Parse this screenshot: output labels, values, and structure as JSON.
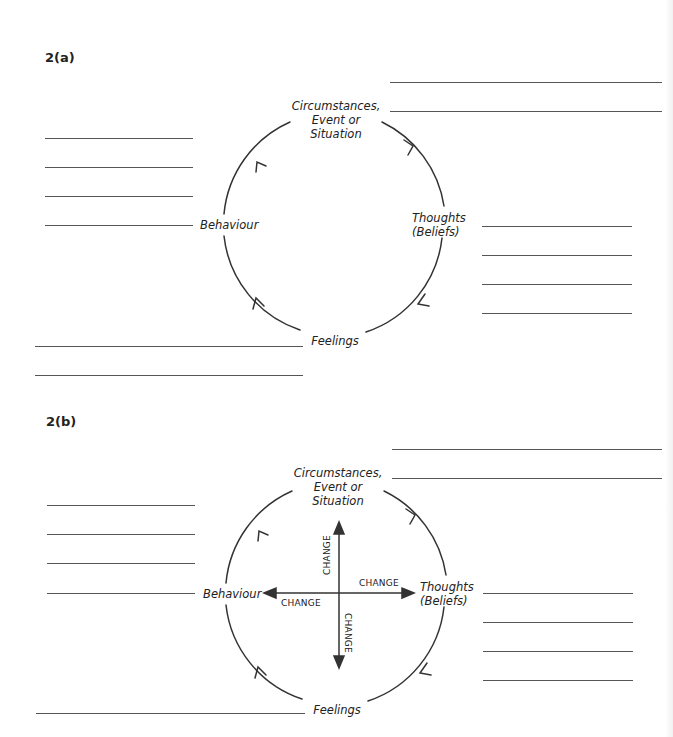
{
  "diagram_a": {
    "heading": "2(a)",
    "nodes": {
      "top": "Circumstances,\nEvent or\nSituation",
      "top_l1": "Circumstances,",
      "top_l2": "Event or",
      "top_l3": "Situation",
      "right_l1": "Thoughts",
      "right_l2": "(Beliefs)",
      "bottom": "Feelings",
      "left": "Behaviour"
    },
    "cycle_direction": "clockwise"
  },
  "diagram_b": {
    "heading": "2(b)",
    "nodes": {
      "top_l1": "Circumstances,",
      "top_l2": "Event or",
      "top_l3": "Situation",
      "right_l1": "Thoughts",
      "right_l2": "(Beliefs)",
      "bottom": "Feelings",
      "left": "Behaviour"
    },
    "change_labels": {
      "up": "CHANGE",
      "right": "CHANGE",
      "left": "CHANGE",
      "down": "CHANGE"
    },
    "cycle_direction": "clockwise"
  },
  "colors": {
    "line": "#555555",
    "text": "#222222",
    "background": "#ffffff"
  }
}
